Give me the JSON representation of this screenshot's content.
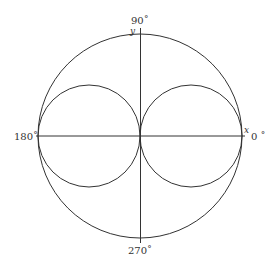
{
  "diagram": {
    "type": "polar-plot",
    "labels": {
      "top": "90˚",
      "bottom": "270˚",
      "left": "180˚",
      "right": "0 ˚",
      "x_axis": "x",
      "y_axis": "y"
    },
    "geometry": {
      "center": [
        140,
        136
      ],
      "outer_radius": 102,
      "inner_radius": 51
    },
    "colors": {
      "stroke": "#333333",
      "background": "#ffffff"
    }
  }
}
